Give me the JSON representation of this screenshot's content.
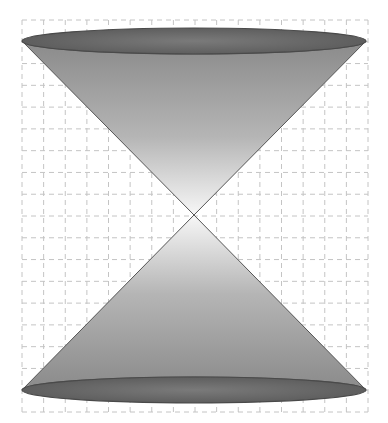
{
  "figure": {
    "type": "double-cone",
    "width": 388,
    "height": 423
  },
  "grid": {
    "x0": 22,
    "y0": 20,
    "x1": 368,
    "y1": 412,
    "columns": 16,
    "rows": 18,
    "stroke": "#c4c4c4",
    "dash": "5,4"
  },
  "cone": {
    "apex": {
      "x": 194,
      "y": 215
    },
    "top_ellipse": {
      "cx": 194,
      "cy": 41,
      "rx": 172,
      "ry": 13
    },
    "bottom_ellipse": {
      "cx": 194,
      "cy": 390,
      "rx": 172,
      "ry": 13
    },
    "colors": {
      "gradient_outer": "#8a8a8a",
      "gradient_inner": "#f7f7f7",
      "ellipse_fill": "#6e6e6e",
      "ellipse_rim": "#4a4a4a",
      "edge": "#555555"
    }
  }
}
